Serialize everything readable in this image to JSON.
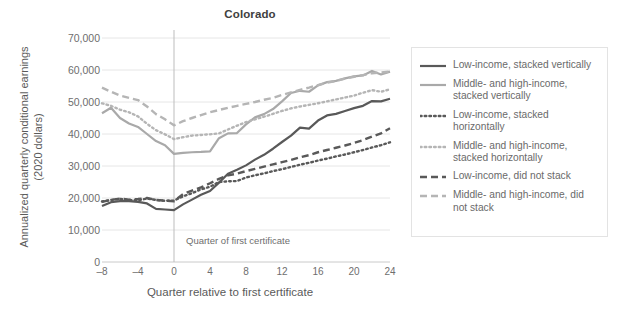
{
  "chart_data": {
    "type": "line",
    "title": "Colorado",
    "xlabel": "Quarter relative to first certificate",
    "ylabel": "Annualized quarterly conditional earnings (2020 dollars)",
    "xlim": [
      -8,
      24
    ],
    "ylim": [
      0,
      70000
    ],
    "xticks": [
      -8,
      -4,
      0,
      4,
      8,
      12,
      16,
      20,
      24
    ],
    "xtick_labels": [
      "–8",
      "–4",
      "0",
      "4",
      "8",
      "12",
      "16",
      "20",
      "24"
    ],
    "yticks": [
      0,
      10000,
      20000,
      30000,
      40000,
      50000,
      60000,
      70000
    ],
    "ytick_labels": [
      "0",
      "10,000",
      "20,000",
      "30,000",
      "40,000",
      "50,000",
      "60,000",
      "70,000"
    ],
    "grid": "horizontal",
    "legend_position": "right",
    "annotations": [
      {
        "text": "Quarter of first certificate",
        "x": 0,
        "type": "vertical-reference-line"
      }
    ],
    "x": [
      -8,
      -7,
      -6,
      -5,
      -4,
      -3,
      -2,
      -1,
      0,
      1,
      2,
      3,
      4,
      5,
      6,
      7,
      8,
      9,
      10,
      11,
      12,
      13,
      14,
      15,
      16,
      17,
      18,
      19,
      20,
      21,
      22,
      23,
      24
    ],
    "series": [
      {
        "name": "Low-income, stacked vertically",
        "color": "#595959",
        "style": "solid",
        "values": [
          17500,
          18700,
          19000,
          19000,
          18800,
          18300,
          16600,
          16400,
          16200,
          18000,
          19500,
          21000,
          22200,
          24800,
          27600,
          28800,
          30200,
          32000,
          33500,
          35400,
          37500,
          39500,
          42000,
          41700,
          44200,
          45800,
          46300,
          47200,
          48100,
          48800,
          50300,
          50200,
          51000
        ]
      },
      {
        "name": "Middle- and high-income, stacked vertically",
        "color": "#a9a9a9",
        "style": "solid",
        "values": [
          46500,
          48200,
          45000,
          43300,
          42200,
          40000,
          37800,
          36500,
          33800,
          34100,
          34300,
          34400,
          34600,
          38700,
          40200,
          40300,
          43000,
          45200,
          46200,
          47800,
          50200,
          52800,
          53500,
          53200,
          55200,
          56200,
          56600,
          57400,
          58000,
          58300,
          59700,
          58600,
          59500
        ]
      },
      {
        "name": "Low-income, stacked horizontally",
        "color": "#595959",
        "style": "dotted",
        "values": [
          18900,
          19400,
          19700,
          19300,
          19300,
          19800,
          19400,
          19100,
          19200,
          20500,
          21500,
          22700,
          23500,
          25000,
          25200,
          25300,
          26400,
          27100,
          27700,
          28400,
          29000,
          29700,
          30400,
          31000,
          31700,
          32300,
          33000,
          33600,
          34300,
          35000,
          35800,
          36500,
          37400
        ]
      },
      {
        "name": "Middle- and high-income, stacked horizontally",
        "color": "#b5b5b5",
        "style": "dotted",
        "values": [
          49600,
          48800,
          47600,
          46800,
          45500,
          43200,
          41200,
          39900,
          38400,
          39000,
          39500,
          39700,
          39900,
          40200,
          41400,
          42600,
          43700,
          44600,
          45400,
          46300,
          47200,
          48000,
          48600,
          49100,
          49600,
          50200,
          50800,
          51400,
          52000,
          52900,
          53700,
          53200,
          54000
        ]
      },
      {
        "name": "Low-income, did not stack",
        "color": "#595959",
        "style": "dashed",
        "values": [
          18800,
          19400,
          19800,
          19500,
          19700,
          20000,
          19400,
          19200,
          19000,
          21200,
          22300,
          23300,
          24600,
          26000,
          27100,
          27600,
          28400,
          29100,
          29800,
          30500,
          31200,
          31900,
          32700,
          33400,
          34300,
          35000,
          35700,
          36400,
          37200,
          38100,
          39200,
          40200,
          41800
        ]
      },
      {
        "name": "Middle- and high-income, did not stack",
        "color": "#b5b5b5",
        "style": "dashed",
        "values": [
          54500,
          53200,
          52000,
          51300,
          50600,
          48600,
          46200,
          44600,
          42700,
          44000,
          45000,
          45900,
          46800,
          47500,
          48200,
          48800,
          49400,
          50000,
          50700,
          51300,
          52200,
          53000,
          53800,
          54500,
          55300,
          56000,
          56600,
          57300,
          57900,
          58400,
          59000,
          59200,
          59500
        ]
      }
    ]
  },
  "legend": {
    "items": [
      {
        "label": "Low-income, stacked vertically"
      },
      {
        "label": "Middle- and high-income, stacked vertically"
      },
      {
        "label": "Low-income, stacked horizontally"
      },
      {
        "label": "Middle- and high-income, stacked horizontally"
      },
      {
        "label": "Low-income, did not stack"
      },
      {
        "label": "Middle- and high-income, did not stack"
      }
    ]
  }
}
